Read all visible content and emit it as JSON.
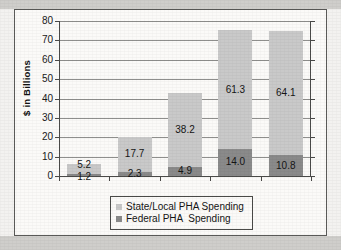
{
  "chart_data": {
    "type": "bar",
    "stacked": true,
    "title": "",
    "xlabel": "",
    "ylabel": "$ in Billions",
    "ylim": [
      0,
      80
    ],
    "ytick_step": 10,
    "yticks": [
      80,
      70,
      60,
      50,
      40,
      30,
      20,
      10,
      0
    ],
    "categories": [
      "1980",
      "1990",
      "2000",
      "2010",
      "2012"
    ],
    "grid": true,
    "legend_position": "bottom",
    "series": [
      {
        "name": "State/Local PHA Spending",
        "color": "#c9c9c9",
        "values": [
          5.2,
          17.7,
          38.2,
          61.3,
          64.1
        ],
        "labels": [
          "5.2",
          "17.7",
          "38.2",
          "61.3",
          "64.1"
        ]
      },
      {
        "name": "Federal PHA  Spending",
        "color": "#8a8a8a",
        "values": [
          1.2,
          2.3,
          4.9,
          14.0,
          10.8
        ],
        "labels": [
          "1.2",
          "2.3",
          "4.9",
          "14.0",
          "10.8"
        ]
      }
    ],
    "totals": [
      6.4,
      20.0,
      43.1,
      75.3,
      74.9
    ]
  },
  "axis": {
    "y_title": "$ in Billions",
    "y_tick_labels": [
      "80",
      "70",
      "60",
      "50",
      "40",
      "30",
      "20",
      "10",
      "0"
    ],
    "x_tick_labels": [
      "1980",
      "1990",
      "2000",
      "2010",
      "2012"
    ]
  },
  "legend": {
    "entries": [
      {
        "label": "State/Local PHA Spending",
        "color": "#c9c9c9"
      },
      {
        "label": "Federal PHA  Spending",
        "color": "#8a8a8a"
      }
    ]
  },
  "colors": {
    "state_local": "#c9c9c9",
    "federal": "#8a8a8a",
    "axis": "#4a4a48",
    "gridline": "#8f8f8d",
    "paper": "#fbfaf8",
    "scan_band": "#cfcecb"
  }
}
